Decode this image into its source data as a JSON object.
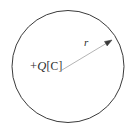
{
  "figure": {
    "name": "uniformly-charged-sphere-radius-diagram",
    "background_color": "#ffffff",
    "width": 136,
    "height": 135
  },
  "circle": {
    "name": "charged-sphere-outline",
    "center_x": 68,
    "center_y": 66.5,
    "radius": 56,
    "stroke_color": "#3a3a3a",
    "stroke_width": 1,
    "fill": "none"
  },
  "radius_arrow": {
    "name": "radius-vector",
    "start_x": 62,
    "start_y": 70,
    "end_x": 112,
    "end_y": 40,
    "stroke_color": "#b5b5b5",
    "stroke_width": 1,
    "arrowhead_color": "#3a3a3a"
  },
  "labels": {
    "charge": {
      "sign": "+",
      "symbol": "Q",
      "unit": "[C]",
      "full_text": "+Q[C]",
      "color": "#2e2e2e",
      "x": 30,
      "y": 60
    },
    "radius": {
      "symbol": "r",
      "color": "#2e2e2e",
      "x": 84,
      "y": 37
    }
  },
  "chart_data": {
    "type": "diagram",
    "title": "",
    "elements": [
      {
        "kind": "circle",
        "label": "",
        "center": [
          68,
          66.5
        ],
        "radius": 56
      },
      {
        "kind": "arrow",
        "label": "r",
        "from": [
          62,
          70
        ],
        "to": [
          112,
          40
        ]
      },
      {
        "kind": "text",
        "label": "+Q[C]",
        "at": [
          32,
          70
        ]
      }
    ]
  }
}
